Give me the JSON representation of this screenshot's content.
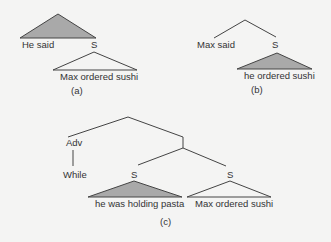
{
  "colors": {
    "background": "#f4f4f3",
    "stroke": "#444444",
    "fill_shaded": "#a9a9a9",
    "text": "#333333"
  },
  "trees": {
    "a": {
      "caption": "(a)",
      "shaded_triangle_label": "He said",
      "s_label": "S",
      "open_triangle_label": "Max ordered sushi"
    },
    "b": {
      "caption": "(b)",
      "left_leaf": "Max said",
      "s_label": "S",
      "shaded_triangle_label": "he ordered sushi"
    },
    "c": {
      "caption": "(c)",
      "adv_label": "Adv",
      "adv_leaf": "While",
      "s_left_label": "S",
      "s_right_label": "S",
      "shaded_triangle_label": "he was holding pasta",
      "open_triangle_label": "Max ordered sushi"
    }
  }
}
